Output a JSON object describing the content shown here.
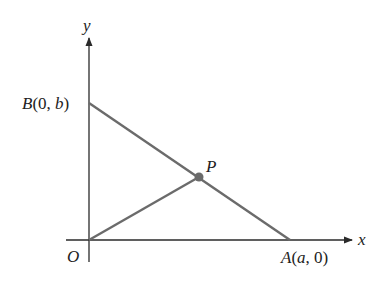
{
  "diagram": {
    "type": "coordinate-geometry",
    "axes": {
      "x_label": "x",
      "y_label": "y",
      "origin_label": "O",
      "axis_color": "#2a2a2a"
    },
    "points": {
      "B": {
        "name": "B",
        "coords_text": "(0, ",
        "param": "b",
        "close": ")"
      },
      "A": {
        "name": "A",
        "coords_text": "(",
        "param": "a",
        "rest": ", 0)"
      },
      "P": {
        "name": "P"
      }
    },
    "segments": [
      {
        "from": "B",
        "to": "A",
        "color": "#6b6b6b"
      },
      {
        "from": "O",
        "to": "P",
        "color": "#6b6b6b"
      }
    ],
    "point_color": "#6b6b6b"
  }
}
